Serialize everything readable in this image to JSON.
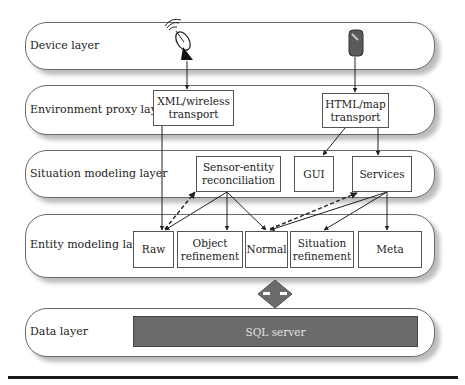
{
  "layers": [
    {
      "id": "device",
      "label": "Device layer"
    },
    {
      "id": "environment-proxy",
      "label": "Environment proxy layer"
    },
    {
      "id": "situation-modeling",
      "label": "Situation modeling layer"
    },
    {
      "id": "entity-modeling",
      "label": "Entity modeling layer"
    },
    {
      "id": "data",
      "label": "Data layer"
    }
  ],
  "device_layer": {
    "icons": [
      "satellite-dish-icon",
      "mobile-phone-icon"
    ]
  },
  "environment_proxy_layer": {
    "boxes": [
      {
        "line1": "XML/wireless",
        "line2": "transport"
      },
      {
        "line1": "HTML/map",
        "line2": "transport"
      }
    ]
  },
  "situation_modeling_layer": {
    "boxes": [
      {
        "line1": "Sensor-entity",
        "line2": "reconciliation"
      },
      {
        "line1": "GUI"
      },
      {
        "line1": "Services"
      }
    ]
  },
  "entity_modeling_layer": {
    "boxes": [
      {
        "line1": "Raw"
      },
      {
        "line1": "Object",
        "line2": "refinement"
      },
      {
        "line1": "Normal"
      },
      {
        "line1": "Situation",
        "line2": "refinement"
      },
      {
        "line1": "Meta"
      }
    ]
  },
  "data_layer": {
    "store": "SQL server"
  },
  "connector": {
    "type": "bidirectional-arrow",
    "color": "#6b6b6b"
  },
  "edges": [
    {
      "from": "satellite-dish",
      "to": "XML/wireless transport",
      "style": "solid"
    },
    {
      "from": "mobile-phone",
      "to": "HTML/map transport",
      "style": "solid"
    },
    {
      "from": "HTML/map transport",
      "to": "GUI",
      "style": "solid"
    },
    {
      "from": "HTML/map transport",
      "to": "Services",
      "style": "solid"
    },
    {
      "from": "XML/wireless transport",
      "to": "Raw",
      "style": "solid"
    },
    {
      "from": "Raw",
      "to": "Sensor-entity reconciliation",
      "style": "dashed"
    },
    {
      "from": "Sensor-entity reconciliation",
      "to": "Raw",
      "style": "solid"
    },
    {
      "from": "Sensor-entity reconciliation",
      "to": "Object refinement",
      "style": "solid"
    },
    {
      "from": "Sensor-entity reconciliation",
      "to": "Normal",
      "style": "solid"
    },
    {
      "from": "Normal",
      "to": "Services",
      "style": "dashed"
    },
    {
      "from": "Services",
      "to": "Normal",
      "style": "solid"
    },
    {
      "from": "Services",
      "to": "Situation refinement",
      "style": "solid"
    },
    {
      "from": "Services",
      "to": "Meta",
      "style": "solid"
    }
  ]
}
